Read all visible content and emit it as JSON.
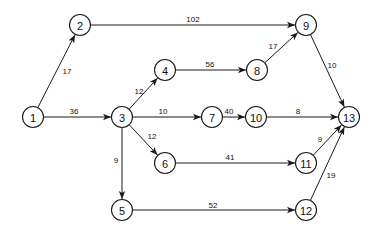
{
  "diagram": {
    "type": "directed-network",
    "node_radius": 10.5,
    "colors": {
      "stroke": "#1a1a1a",
      "text": "#111111",
      "background": "#ffffff"
    },
    "nodes": [
      {
        "id": "1",
        "label": "1",
        "x": 33,
        "y": 117
      },
      {
        "id": "2",
        "label": "2",
        "x": 80,
        "y": 25
      },
      {
        "id": "3",
        "label": "3",
        "x": 122,
        "y": 117
      },
      {
        "id": "4",
        "label": "4",
        "x": 165,
        "y": 70
      },
      {
        "id": "5",
        "label": "5",
        "x": 122,
        "y": 210
      },
      {
        "id": "6",
        "label": "6",
        "x": 165,
        "y": 163
      },
      {
        "id": "7",
        "label": "7",
        "x": 212,
        "y": 117
      },
      {
        "id": "8",
        "label": "8",
        "x": 257,
        "y": 70
      },
      {
        "id": "9",
        "label": "9",
        "x": 306,
        "y": 25
      },
      {
        "id": "10",
        "label": "10",
        "x": 256,
        "y": 117
      },
      {
        "id": "11",
        "label": "11",
        "x": 306,
        "y": 163
      },
      {
        "id": "12",
        "label": "12",
        "x": 306,
        "y": 210
      },
      {
        "id": "13",
        "label": "13",
        "x": 349,
        "y": 117
      }
    ],
    "edges": [
      {
        "from": "1",
        "to": "2",
        "weight": "17",
        "lx": 67,
        "ly": 71
      },
      {
        "from": "1",
        "to": "3",
        "weight": "36",
        "lx": 74,
        "ly": 111
      },
      {
        "from": "2",
        "to": "9",
        "weight": "102",
        "lx": 193,
        "ly": 19
      },
      {
        "from": "3",
        "to": "4",
        "weight": "12",
        "lx": 139,
        "ly": 91
      },
      {
        "from": "3",
        "to": "7",
        "weight": "10",
        "lx": 163,
        "ly": 111
      },
      {
        "from": "3",
        "to": "6",
        "weight": "12",
        "lx": 152,
        "ly": 136
      },
      {
        "from": "3",
        "to": "5",
        "weight": "9",
        "lx": 116,
        "ly": 160
      },
      {
        "from": "4",
        "to": "8",
        "weight": "56",
        "lx": 210,
        "ly": 64
      },
      {
        "from": "8",
        "to": "9",
        "weight": "17",
        "lx": 273,
        "ly": 46
      },
      {
        "from": "7",
        "to": "10",
        "weight": "40",
        "lx": 229,
        "ly": 111
      },
      {
        "from": "9",
        "to": "13",
        "weight": "10",
        "lx": 332,
        "ly": 65
      },
      {
        "from": "10",
        "to": "13",
        "weight": "8",
        "lx": 298,
        "ly": 111
      },
      {
        "from": "6",
        "to": "11",
        "weight": "41",
        "lx": 230,
        "ly": 157
      },
      {
        "from": "11",
        "to": "13",
        "weight": "9",
        "lx": 320,
        "ly": 139
      },
      {
        "from": "5",
        "to": "12",
        "weight": "52",
        "lx": 213,
        "ly": 205
      },
      {
        "from": "12",
        "to": "13",
        "weight": "19",
        "lx": 331,
        "ly": 175
      }
    ]
  }
}
